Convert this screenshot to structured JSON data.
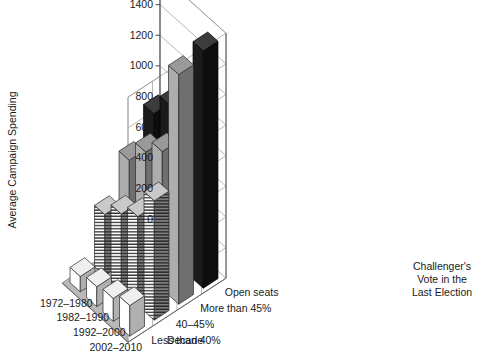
{
  "chart_data": {
    "type": "bar",
    "subtype": "3d-grouped-bar",
    "title": "",
    "xlabel": "Decade",
    "ylabel": "Average Campaign Spending",
    "categories": [
      "1972–1980",
      "1982–1990",
      "1992–2000",
      "2002–2010"
    ],
    "series": [
      {
        "name": "Less than 40%",
        "values": [
          100,
          130,
          150,
          200
        ],
        "fill": "white",
        "color": "#ffffff"
      },
      {
        "name": "40–45%",
        "values": [
          400,
          500,
          580,
          780
        ],
        "fill": "hstripes",
        "color": "#f2f2f2"
      },
      {
        "name": "More than 45%",
        "values": [
          650,
          800,
          900,
          1500
        ],
        "fill": "gray",
        "color": "#a8a8a8"
      },
      {
        "name": "Open seats",
        "values": [
          850,
          1000,
          1100,
          1550
        ],
        "fill": "black",
        "color": "#1a1a1a"
      }
    ],
    "legend": {
      "title": "Challenger's\nVote in the\nLast Election",
      "title_lines": [
        "Challenger's",
        "Vote in the",
        "Last Election"
      ],
      "entries": [
        "Open seats",
        "More than 45%",
        "40–45%",
        "Less than 40%"
      ],
      "position": "right-depth-axis"
    },
    "ylim": [
      0,
      1600
    ],
    "yticks": [
      0,
      200,
      400,
      600,
      800,
      1000,
      1200,
      1400,
      1600
    ],
    "ytick_labels": [
      "0",
      "200",
      "400",
      "600",
      "800",
      "1000",
      "1200",
      "1400",
      "1600"
    ],
    "grid": true,
    "grid_color": "#9a9a9a",
    "floor_color": "#b9b9b9",
    "wall_color": "#ffffff"
  },
  "axes": {
    "y_title": "Average Campaign Spending",
    "x_title": "Decade"
  }
}
